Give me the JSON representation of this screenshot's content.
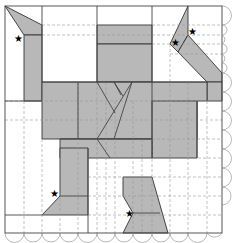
{
  "diagram": {
    "type": "origami-crease-pattern",
    "colors": {
      "shaded_region": "#b8b8b8",
      "solid_line": "#444444",
      "dashed_line": "#999999",
      "background": "#ffffff",
      "star_marker": "#000000"
    },
    "grid": {
      "columns": 12,
      "rows": 12,
      "x_lines": [
        5,
        24,
        42,
        60,
        78,
        97,
        115,
        133,
        152,
        170,
        188,
        207,
        222
      ],
      "y_lines": [
        5,
        25,
        44,
        63,
        82,
        101,
        120,
        139,
        158,
        177,
        196,
        215,
        233
      ]
    },
    "edge_markers": {
      "bottom": "semicircle reference marks along bottom edge",
      "right": "semicircle reference marks along right edge"
    },
    "star_markers": [
      {
        "label": "star-top-left",
        "x": 18,
        "y": 38
      },
      {
        "label": "star-top-right-inner",
        "x": 176,
        "y": 42
      },
      {
        "label": "star-top-right-outer",
        "x": 193,
        "y": 31
      },
      {
        "label": "star-bottom-left",
        "x": 55,
        "y": 193
      },
      {
        "label": "star-bottom-center",
        "x": 130,
        "y": 213
      }
    ]
  }
}
